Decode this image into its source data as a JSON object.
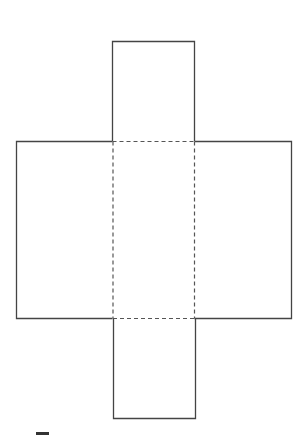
{
  "diagram": {
    "type": "box-net",
    "colors": {
      "background": "#ffffff",
      "stroke": "#444444",
      "fold_line": "#555555"
    },
    "faces": [
      {
        "id": "top-flap",
        "x": 112,
        "y": 41,
        "width": 82,
        "height": 100
      },
      {
        "id": "left-panel",
        "x": 16,
        "y": 141,
        "width": 96,
        "height": 177
      },
      {
        "id": "center-panel",
        "x": 112,
        "y": 141,
        "width": 82,
        "height": 177
      },
      {
        "id": "right-panel",
        "x": 194,
        "y": 141,
        "width": 97,
        "height": 177
      },
      {
        "id": "bottom-flap",
        "x": 113,
        "y": 318,
        "width": 82,
        "height": 100
      }
    ],
    "fold_lines": [
      {
        "id": "fold-top",
        "x1": 112,
        "y1": 141,
        "x2": 194,
        "y2": 141
      },
      {
        "id": "fold-left",
        "x1": 112,
        "y1": 141,
        "x2": 112,
        "y2": 318
      },
      {
        "id": "fold-right",
        "x1": 194,
        "y1": 141,
        "x2": 194,
        "y2": 318
      },
      {
        "id": "fold-bottom",
        "x1": 112,
        "y1": 318,
        "x2": 194,
        "y2": 318
      }
    ]
  }
}
